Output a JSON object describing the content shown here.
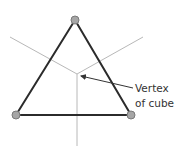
{
  "diagram": {
    "label_line1": "Vertex",
    "label_line2": "of cube",
    "colors": {
      "triangle": "#2b2b2b",
      "axes": "#b8b8b8",
      "vertex_fill": "#a6a6a6",
      "vertex_stroke": "#7a7a7a",
      "arrow": "#333333"
    }
  }
}
